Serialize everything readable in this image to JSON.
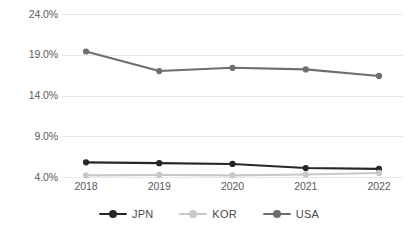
{
  "chart_data": {
    "type": "line",
    "title": "",
    "subtitle": "",
    "xlabel": "",
    "ylabel": "",
    "categories": [
      "2018",
      "2019",
      "2020",
      "2021",
      "2022"
    ],
    "ytick_labels": [
      "24.0%",
      "19.0%",
      "14.0%",
      "9.0%",
      "4.0%"
    ],
    "ytick_values": [
      24.0,
      19.0,
      14.0,
      9.0,
      4.0
    ],
    "ylim": [
      4.0,
      24.0
    ],
    "grid": true,
    "legend_position": "bottom",
    "series": [
      {
        "name": "JPN",
        "color": "#262626",
        "marker": "circle",
        "values": [
          5.8,
          5.7,
          5.6,
          5.1,
          5.0
        ]
      },
      {
        "name": "KOR",
        "color": "#c8c8c8",
        "marker": "circle",
        "values": [
          4.2,
          4.25,
          4.2,
          4.3,
          4.5
        ]
      },
      {
        "name": "USA",
        "color": "#6e6e6e",
        "marker": "circle",
        "values": [
          19.4,
          17.0,
          17.4,
          17.2,
          16.4
        ]
      }
    ]
  },
  "legend": {
    "items": [
      {
        "label": "JPN"
      },
      {
        "label": "KOR"
      },
      {
        "label": "USA"
      }
    ]
  },
  "colors": {
    "gridline": "#e8e8e8",
    "axis_text": "#5a5a5a",
    "background": "#ffffff",
    "jpn": "#262626",
    "kor": "#c8c8c8",
    "usa": "#6e6e6e"
  }
}
